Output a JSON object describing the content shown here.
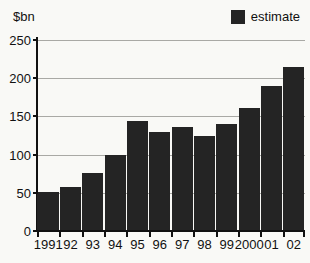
{
  "chart": {
    "unit_label": "$bn",
    "legend_label": "estimate"
  },
  "chart_data": {
    "type": "bar",
    "categories": [
      "1991",
      "92",
      "93",
      "94",
      "95",
      "96",
      "97",
      "98",
      "99",
      "2000",
      "01",
      "02"
    ],
    "values": [
      51,
      57,
      76,
      100,
      144,
      130,
      136,
      125,
      140,
      161,
      190,
      215
    ],
    "title": "",
    "xlabel": "",
    "ylabel": "$bn",
    "ylim": [
      0,
      250
    ],
    "yticks": [
      0,
      50,
      100,
      150,
      200,
      250
    ],
    "legend": [
      "estimate"
    ],
    "legend_position": "top-right",
    "grid": true,
    "bar_color": "#242424",
    "axis_color": "#111111",
    "gridline_color": "#a9a9a5",
    "background_color": "#f9f9f6"
  }
}
